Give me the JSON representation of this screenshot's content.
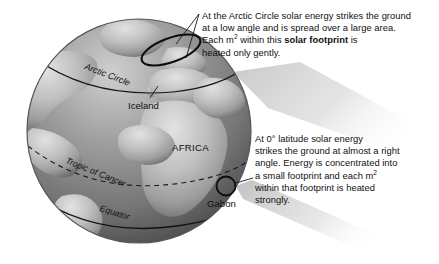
{
  "figure": {
    "background_color": "#ffffff",
    "width": 439,
    "height": 264
  },
  "globe": {
    "ocean_color": "#7d7d7d",
    "land_color": "#b4b4b4",
    "outline_color": "#5d5d5d",
    "terminator_shadow_color": "#4f4f4f",
    "beam_color": "#d9d9d9"
  },
  "callouts": [
    {
      "id": "arctic",
      "lines": [
        "At the Arctic Circle solar energy strikes the ground",
        "at a low angle and is spread over a large area.",
        "Each m|2| within this **solar footprint** is",
        "heated only gently."
      ],
      "line1": "At the Arctic Circle solar energy strikes the ground",
      "line2": "at a low angle and is spread over a large area.",
      "line3_a": "Each m",
      "line3_sup": "2",
      "line3_b": " within this ",
      "line3_bold": "solar footprint",
      "line3_c": " is",
      "line4": "heated only gently."
    },
    {
      "id": "equator",
      "line1": "At 0° latitude solar energy",
      "line2": "strikes the ground at almost a right",
      "line3": "angle. Energy is concentrated into",
      "line4_a": "a small footprint and each m",
      "line4_sup": "2",
      "line5": "within that footprint is heated",
      "line6": "strongly."
    }
  ],
  "map_labels": {
    "arctic_circle": "Arctic Circle",
    "iceland": "Iceland",
    "tropic_of_cancer": "Tropic of Cancer",
    "africa": "AFRICA",
    "equator": "Equator",
    "gabon": "Gabon"
  },
  "markers": {
    "arctic_footprint": {
      "shape": "ellipse",
      "label": "large solar footprint ellipse"
    },
    "equator_footprint": {
      "shape": "circle",
      "label": "small solar footprint circle"
    }
  }
}
